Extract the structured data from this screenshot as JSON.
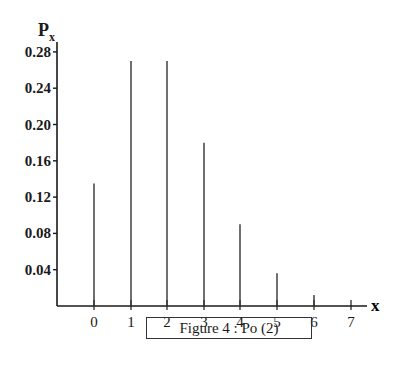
{
  "chart_data": {
    "type": "bar",
    "title": "Figure 4 : Po (2)",
    "xlabel": "x",
    "ylabel": "P",
    "ylabel_sub": "x",
    "categories": [
      "0",
      "1",
      "2",
      "3",
      "4",
      "5",
      "6",
      "7"
    ],
    "values": [
      0.135,
      0.27,
      0.27,
      0.18,
      0.09,
      0.036,
      0.012,
      0.0
    ],
    "yticks": [
      "0.04",
      "0.08",
      "0.12",
      "0.16",
      "0.20",
      "0.24",
      "0.28"
    ],
    "ytick_values": [
      0.04,
      0.08,
      0.12,
      0.16,
      0.2,
      0.24,
      0.28
    ],
    "ylim": [
      0,
      0.29
    ],
    "grid": false,
    "legend": null,
    "bar_style": "vertical lines (spikes)"
  },
  "caption": "Figure 4 : Po (2)",
  "axis": {
    "x_label": "x",
    "y_label_main": "P",
    "y_label_sub": "x"
  }
}
